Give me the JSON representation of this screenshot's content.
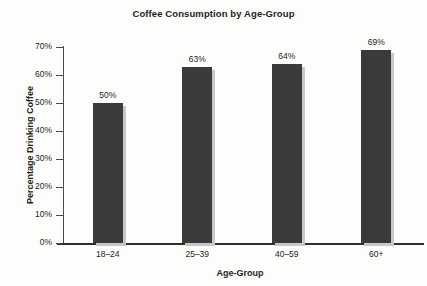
{
  "chart_data": {
    "type": "bar",
    "title": "Coffee Consumption by Age-Group",
    "xlabel": "Age-Group",
    "ylabel": "Percentage Drinking Coffee",
    "categories": [
      "18–24",
      "25–39",
      "40–59",
      "60+"
    ],
    "values": [
      50,
      63,
      64,
      69
    ],
    "value_labels": [
      "50%",
      "63%",
      "64%",
      "69%"
    ],
    "ylim": [
      0,
      70
    ],
    "yticks": [
      0,
      10,
      20,
      30,
      40,
      50,
      60,
      70
    ],
    "ytick_labels": [
      "0%",
      "10%",
      "20%",
      "30%",
      "40%",
      "50%",
      "60%",
      "70%"
    ],
    "grid": false,
    "legend": false,
    "legend_position": "none",
    "bar_color": "#3b3b3b",
    "bar_shadow_color": "#c8c8c8",
    "axis_color": "#2f2f2f",
    "text_color": "#231f20",
    "background_color": "#fdfdfc"
  }
}
